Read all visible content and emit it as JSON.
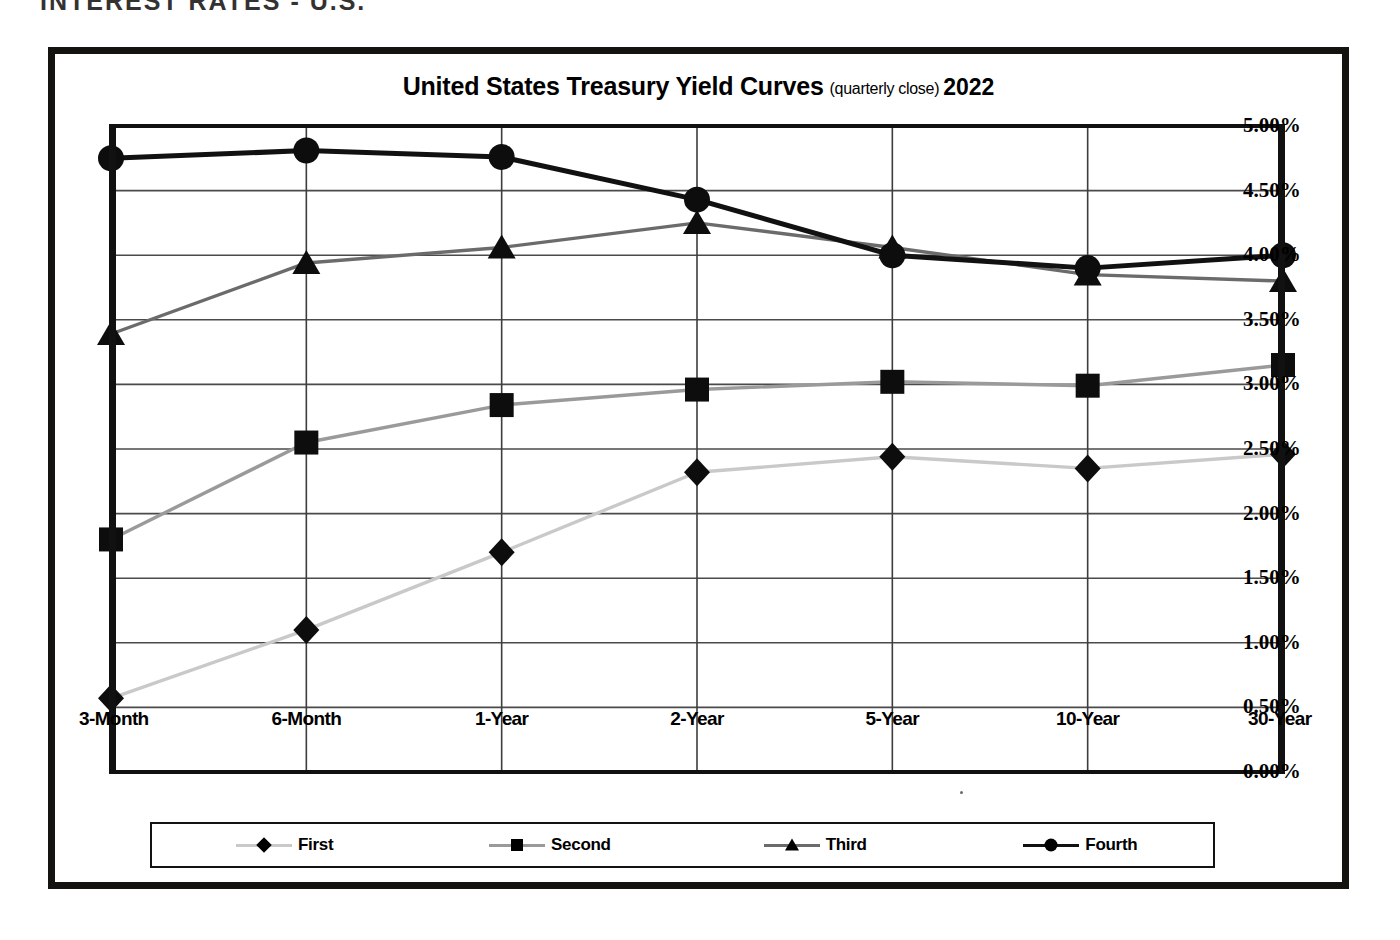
{
  "page": {
    "header_text": "INTEREST RATES - U.S."
  },
  "chart": {
    "title_main": "United States Treasury Yield Curves",
    "title_sub": "(quarterly close)",
    "title_year": "2022"
  },
  "chart_data": {
    "type": "line",
    "xlabel": "",
    "ylabel": "",
    "ylim": [
      0,
      5
    ],
    "ytick_labels": [
      "5.00%",
      "4.50%",
      "4.00%",
      "3.50%",
      "3.00%",
      "2.50%",
      "2.00%",
      "1.50%",
      "1.00%",
      "0.50%",
      "0.00%"
    ],
    "ytick_values": [
      5.0,
      4.5,
      4.0,
      3.5,
      3.0,
      2.5,
      2.0,
      1.5,
      1.0,
      0.5,
      0.0
    ],
    "grid": true,
    "legend_position": "bottom",
    "categories": [
      "3-Month",
      "6-Month",
      "1-Year",
      "2-Year",
      "5-Year",
      "10-Year",
      "30-Year"
    ],
    "series": [
      {
        "name": "First",
        "marker": "diamond",
        "color": "#c9c9c9",
        "values": [
          0.57,
          1.1,
          1.7,
          2.32,
          2.44,
          2.35,
          2.46
        ]
      },
      {
        "name": "Second",
        "marker": "square",
        "color": "#9a9a9a",
        "values": [
          1.8,
          2.55,
          2.84,
          2.96,
          3.02,
          2.99,
          3.15
        ]
      },
      {
        "name": "Third",
        "marker": "triangle",
        "color": "#6b6b6b",
        "values": [
          3.39,
          3.94,
          4.06,
          4.25,
          4.06,
          3.85,
          3.8
        ]
      },
      {
        "name": "Fourth",
        "marker": "circle",
        "color": "#111111",
        "values": [
          4.75,
          4.81,
          4.76,
          4.43,
          4.0,
          3.9,
          4.0
        ]
      }
    ]
  }
}
